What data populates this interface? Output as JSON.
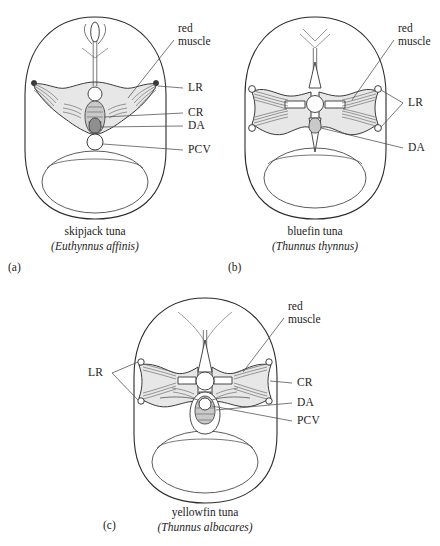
{
  "figure": {
    "type": "anatomical-diagram",
    "colors": {
      "red_muscle_fill": "#e7e7e7",
      "outline_stroke": "#2b2b2b",
      "label_text": "#1c1c1c",
      "leader_line": "#4e4e4e",
      "background": "#ffffff"
    },
    "abbreviations": {
      "LR": "lateral rete",
      "CR": "central rete",
      "DA": "dorsal aorta",
      "PCV": "postcardinal vein"
    }
  },
  "panels": [
    {
      "letter": "(a)",
      "common_name": "skipjack tuna",
      "scientific_name": "(Euthynnus affinis)",
      "labels": [
        {
          "id": "red-muscle",
          "line1": "red",
          "line2": "muscle"
        },
        {
          "id": "lr",
          "text": "LR"
        },
        {
          "id": "cr",
          "text": "CR"
        },
        {
          "id": "da",
          "text": "DA"
        },
        {
          "id": "pcv",
          "text": "PCV"
        }
      ]
    },
    {
      "letter": "(b)",
      "common_name": "bluefin tuna",
      "scientific_name": "(Thunnus thynnus)",
      "labels": [
        {
          "id": "red-muscle",
          "line1": "red",
          "line2": "muscle"
        },
        {
          "id": "lr",
          "text": "LR"
        },
        {
          "id": "da",
          "text": "DA"
        }
      ]
    },
    {
      "letter": "(c)",
      "common_name": "yellowfin tuna",
      "scientific_name": "(Thunnus albacares)",
      "labels": [
        {
          "id": "red-muscle",
          "line1": "red",
          "line2": "muscle"
        },
        {
          "id": "lr",
          "text": "LR"
        },
        {
          "id": "cr",
          "text": "CR"
        },
        {
          "id": "da",
          "text": "DA"
        },
        {
          "id": "pcv",
          "text": "PCV"
        }
      ]
    }
  ]
}
